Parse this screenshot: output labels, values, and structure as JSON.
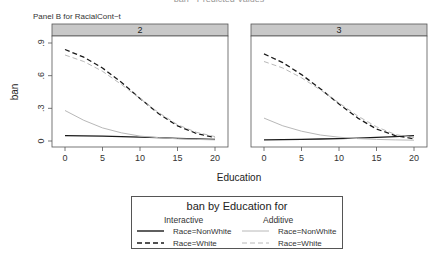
{
  "page": {
    "title_partial": "ban  ·  Predicted Values",
    "subtitle": "Panel B for RacialCont~t"
  },
  "chart_data": {
    "type": "line",
    "subtitle": "Panel B for RacialCont~t",
    "xlabel": "Education",
    "ylabel": "ban",
    "xlim": [
      0,
      20
    ],
    "ylim": [
      0,
      0.9
    ],
    "x_ticks": [
      "0",
      "5",
      "10",
      "15",
      "20"
    ],
    "y_ticks": [
      "0",
      ".3",
      ".6",
      ".9"
    ],
    "grid": false,
    "legend_position": "bottom",
    "x": [
      0,
      2.5,
      5,
      7.5,
      10,
      12.5,
      15,
      17.5,
      20
    ],
    "panels": [
      {
        "label": "2",
        "series": [
          {
            "name": "Interactive Race=NonWhite",
            "style": "solid-dark",
            "values": [
              0.05,
              0.048,
              0.045,
              0.04,
              0.035,
              0.03,
              0.025,
              0.02,
              0.015
            ]
          },
          {
            "name": "Interactive Race=White",
            "style": "dashed-dark",
            "values": [
              0.84,
              0.77,
              0.67,
              0.54,
              0.39,
              0.25,
              0.14,
              0.07,
              0.03
            ]
          },
          {
            "name": "Additive Race=NonWhite",
            "style": "solid-light",
            "values": [
              0.28,
              0.19,
              0.12,
              0.075,
              0.045,
              0.03,
              0.02,
              0.015,
              0.01
            ]
          },
          {
            "name": "Additive Race=White",
            "style": "dashed-light",
            "values": [
              0.79,
              0.73,
              0.64,
              0.52,
              0.39,
              0.26,
              0.15,
              0.08,
              0.04
            ]
          }
        ]
      },
      {
        "label": "3",
        "series": [
          {
            "name": "Interactive Race=NonWhite",
            "style": "solid-dark",
            "values": [
              0.01,
              0.012,
              0.015,
              0.018,
              0.022,
              0.027,
              0.033,
              0.04,
              0.05
            ]
          },
          {
            "name": "Interactive Race=White",
            "style": "dashed-dark",
            "values": [
              0.8,
              0.72,
              0.61,
              0.48,
              0.34,
              0.21,
              0.11,
              0.05,
              0.02
            ]
          },
          {
            "name": "Additive Race=NonWhite",
            "style": "solid-light",
            "values": [
              0.21,
              0.14,
              0.09,
              0.055,
              0.035,
              0.022,
              0.015,
              0.01,
              0.007
            ]
          },
          {
            "name": "Additive Race=White",
            "style": "dashed-light",
            "values": [
              0.73,
              0.67,
              0.58,
              0.47,
              0.35,
              0.23,
              0.13,
              0.06,
              0.03
            ]
          }
        ]
      }
    ],
    "legend": {
      "title": "ban by Education for",
      "groups": [
        {
          "heading": "Interactive",
          "items": [
            "Race=NonWhite",
            "Race=White"
          ]
        },
        {
          "heading": "Additive",
          "items": [
            "Race=NonWhite",
            "Race=White"
          ]
        }
      ]
    }
  },
  "colors": {
    "dark_line": "#1a1a1a",
    "light_line": "#b8b8b8",
    "strip_fill": "#c8c8c8",
    "axis": "#555555"
  }
}
